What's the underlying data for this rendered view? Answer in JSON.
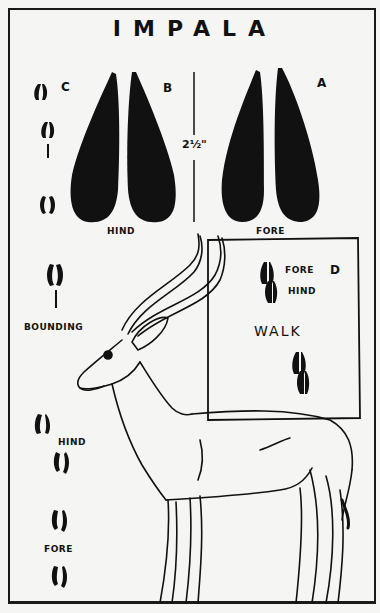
{
  "title": "IMPALA",
  "measurement": "2½\"",
  "large_prints": {
    "hind": {
      "letter": "B",
      "label": "HIND"
    },
    "fore": {
      "letter": "A",
      "label": "FORE"
    }
  },
  "gait_c": {
    "letter": "C"
  },
  "bounding": {
    "label": "BOUNDING"
  },
  "walk_box": {
    "letter": "D",
    "fore_label": "FORE",
    "hind_label": "HIND",
    "gait_label": "WALK"
  },
  "lower_left_tracks": {
    "hind_label": "HIND",
    "fore_label": "FORE"
  },
  "colors": {
    "ink": "#111111",
    "paper": "#f5f5f3"
  }
}
